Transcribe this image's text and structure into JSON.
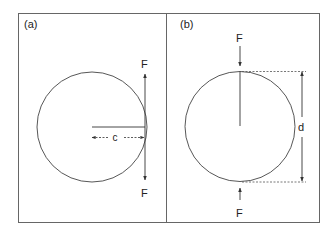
{
  "figure": {
    "panels": [
      {
        "id": "a",
        "label": "(a)",
        "force_top_label": "F",
        "force_bottom_label": "F",
        "dimension_label": "c",
        "description": "Circle with a tangential couple of forces F acting at the right edge, offset c from center"
      },
      {
        "id": "b",
        "label": "(b)",
        "force_top_label": "F",
        "force_bottom_label": "F",
        "dimension_label": "d",
        "description": "Circle compressed diametrically by opposing forces F, with diameter d"
      }
    ],
    "colors": {
      "stroke": "#333333",
      "frame": "#555555",
      "background": "#ffffff"
    }
  }
}
